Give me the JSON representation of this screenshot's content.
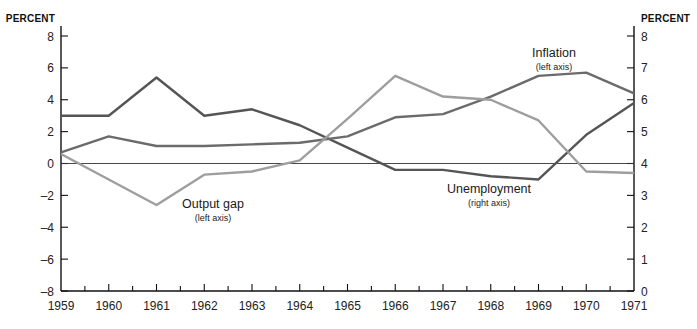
{
  "chart_data": {
    "type": "line",
    "title": "",
    "x": [
      1959,
      1960,
      1961,
      1962,
      1963,
      1964,
      1965,
      1966,
      1967,
      1968,
      1969,
      1970,
      1971
    ],
    "xtick_labels": [
      "1959",
      "1960",
      "1961",
      "1962",
      "1963",
      "1964",
      "1965",
      "1966",
      "1967",
      "1968",
      "1969",
      "1970",
      "1971"
    ],
    "xlabel": "",
    "grid": false,
    "legend_position": "inline-annotations",
    "left_axis": {
      "title": "PERCENT",
      "ylim": [
        -8,
        8
      ],
      "ticks": [
        8,
        6,
        4,
        2,
        0,
        -2,
        -4,
        -6,
        -8
      ],
      "tick_labels": [
        "8",
        "6",
        "4",
        "2",
        "0",
        "–2",
        "–4",
        "–6",
        "–8"
      ]
    },
    "right_axis": {
      "title": "PERCENT",
      "ylim": [
        0,
        8
      ],
      "ticks": [
        8,
        7,
        6,
        5,
        4,
        3,
        2,
        1,
        0
      ],
      "tick_labels": [
        "8",
        "7",
        "6",
        "5",
        "4",
        "3",
        "2",
        "1",
        "0"
      ]
    },
    "series": [
      {
        "name": "Unemployment",
        "axis": "right",
        "color": "#555555",
        "annotation": {
          "label": "Unemployment",
          "sublabel": "(right axis)"
        },
        "values": [
          5.5,
          5.5,
          6.7,
          5.5,
          5.7,
          5.2,
          4.5,
          3.8,
          3.8,
          3.6,
          3.5,
          4.9,
          5.9
        ]
      },
      {
        "name": "Inflation",
        "axis": "left",
        "color": "#6b6b6b",
        "annotation": {
          "label": "Inflation",
          "sublabel": "(left axis)"
        },
        "values": [
          0.7,
          1.7,
          1.1,
          1.1,
          1.2,
          1.3,
          1.7,
          2.9,
          3.1,
          4.2,
          5.5,
          5.7,
          4.4
        ]
      },
      {
        "name": "Output gap",
        "axis": "left",
        "color": "#9e9e9e",
        "annotation": {
          "label": "Output gap",
          "sublabel": "(left axis)"
        },
        "values": [
          0.6,
          -1.0,
          -2.6,
          -0.7,
          -0.5,
          0.2,
          2.8,
          5.5,
          4.2,
          4.0,
          2.7,
          -0.5,
          -0.6
        ]
      }
    ],
    "annotations": [
      {
        "id": "inflation",
        "label": "Inflation",
        "sublabel": "(left axis)",
        "x": 554,
        "y": 57
      },
      {
        "id": "output-gap",
        "label": "Output gap",
        "sublabel": "(left axis)",
        "x": 213,
        "y": 208
      },
      {
        "id": "unemployment",
        "label": "Unemployment",
        "sublabel": "(right axis)",
        "x": 489,
        "y": 193
      }
    ]
  },
  "labels": {
    "left_axis_title": "PERCENT",
    "right_axis_title": "PERCENT"
  }
}
